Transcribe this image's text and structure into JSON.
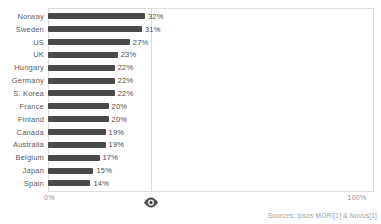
{
  "chart_data": {
    "type": "bar",
    "orientation": "horizontal",
    "title": "",
    "xlabel": "",
    "ylabel": "",
    "xlim": [
      0,
      100
    ],
    "x_axis_ticks": [
      "0%",
      "100%"
    ],
    "grid": "single vertical reference line at ~34%",
    "legend": "none",
    "bar_color": "#4a4a4a",
    "gridline_percent": 34,
    "categories": [
      "Norway",
      "Sweden",
      "US",
      "UK",
      "Hungary",
      "Germany",
      "S. Korea",
      "France",
      "Finland",
      "Canada",
      "Australia",
      "Belgium",
      "Japan",
      "Spain"
    ],
    "values": [
      32,
      31,
      27,
      23,
      22,
      22,
      22,
      20,
      20,
      19,
      19,
      17,
      15,
      14
    ],
    "value_labels": [
      "32%",
      "31%",
      "27%",
      "23%",
      "22%",
      "22%",
      "22%",
      "20%",
      "20%",
      "19%",
      "19%",
      "17%",
      "15%",
      "14%"
    ]
  },
  "axis": {
    "min_label": "0%",
    "max_label": "100%"
  },
  "footer": {
    "source_text": "Sources: Ipsos MORI[1] & Novus[1]"
  },
  "icons": {
    "eye_marker": "eye-icon"
  }
}
